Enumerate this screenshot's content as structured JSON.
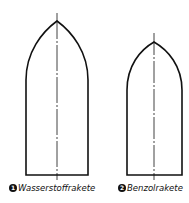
{
  "diagram": {
    "type": "rocket-shape-comparison",
    "rockets": [
      {
        "number": "1",
        "label": "Wasserstoffrakete"
      },
      {
        "number": "2",
        "label": "Benzolrakete"
      }
    ],
    "colors": {
      "line": "#111111",
      "background": "#ffffff"
    }
  }
}
